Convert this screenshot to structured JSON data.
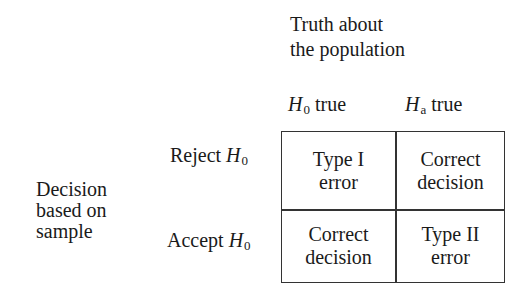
{
  "column_header": {
    "title_line1": "Truth about",
    "title_line2": "the population",
    "columns": [
      {
        "symbol": "H",
        "subscript": "0",
        "suffix": " true"
      },
      {
        "symbol": "H",
        "subscript": "a",
        "suffix": " true"
      }
    ]
  },
  "row_header": {
    "title_lines": [
      "Decision",
      "based on",
      "sample"
    ],
    "rows": [
      {
        "prefix": "Reject ",
        "symbol": "H",
        "subscript": "0"
      },
      {
        "prefix": "Accept ",
        "symbol": "H",
        "subscript": "0"
      }
    ]
  },
  "cells": [
    [
      {
        "line1": "Type I",
        "line2": "error"
      },
      {
        "line1": "Correct",
        "line2": "decision"
      }
    ],
    [
      {
        "line1": "Correct",
        "line2": "decision"
      },
      {
        "line1": "Type II",
        "line2": "error"
      }
    ]
  ]
}
